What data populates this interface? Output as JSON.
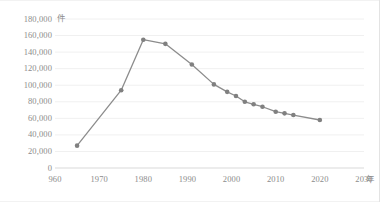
{
  "chart_data": {
    "type": "line",
    "title": "",
    "xlabel": "年",
    "ylabel": "件",
    "xlim": [
      1960,
      2030
    ],
    "ylim": [
      0,
      180000
    ],
    "grid": true,
    "legend": null,
    "series": [
      {
        "name": "",
        "color": "#8c8c8c",
        "points": [
          {
            "x": 1965,
            "y": 27000
          },
          {
            "x": 1975,
            "y": 94000
          },
          {
            "x": 1980,
            "y": 155000
          },
          {
            "x": 1985,
            "y": 150000
          },
          {
            "x": 1991,
            "y": 125000
          },
          {
            "x": 1996,
            "y": 101000
          },
          {
            "x": 1999,
            "y": 92000
          },
          {
            "x": 2001,
            "y": 87000
          },
          {
            "x": 2003,
            "y": 80000
          },
          {
            "x": 2005,
            "y": 77000
          },
          {
            "x": 2007,
            "y": 74000
          },
          {
            "x": 2010,
            "y": 68000
          },
          {
            "x": 2012,
            "y": 66000
          },
          {
            "x": 2014,
            "y": 64000
          },
          {
            "x": 2020,
            "y": 58000
          }
        ]
      }
    ],
    "y_ticks": [
      {
        "value": 180000,
        "label": "180,000"
      },
      {
        "value": 160000,
        "label": "160,000"
      },
      {
        "value": 140000,
        "label": "140,000"
      },
      {
        "value": 120000,
        "label": "120,000"
      },
      {
        "value": 100000,
        "label": "100,000"
      },
      {
        "value": 80000,
        "label": "80,000"
      },
      {
        "value": 60000,
        "label": "60,000"
      },
      {
        "value": 40000,
        "label": "40,000"
      },
      {
        "value": 20000,
        "label": "20,000"
      },
      {
        "value": 0,
        "label": "0"
      }
    ],
    "x_ticks": [
      {
        "value": 1960,
        "label": "960"
      },
      {
        "value": 1970,
        "label": "1970"
      },
      {
        "value": 1980,
        "label": "1980"
      },
      {
        "value": 1990,
        "label": "1990"
      },
      {
        "value": 2000,
        "label": "2000"
      },
      {
        "value": 2010,
        "label": "2010"
      },
      {
        "value": 2020,
        "label": "2020"
      },
      {
        "value": 2030,
        "label": "2030"
      }
    ],
    "colors": {
      "line": "#8c8c8c",
      "marker": "#808080",
      "grid": "#f0f0f0",
      "axis": "#d9d9d9",
      "text": "#8c8c8c"
    }
  }
}
